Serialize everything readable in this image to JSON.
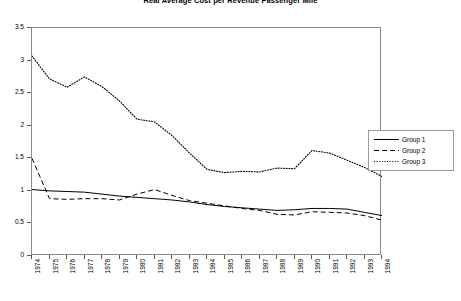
{
  "chart_data": {
    "type": "line",
    "title": "Real Average Cost per Revenue Passenger Mile",
    "xlabel": "",
    "ylabel": "",
    "xlim": [
      1974,
      1994
    ],
    "ylim": [
      0,
      3.5
    ],
    "ytick_labels": [
      "3.5",
      "3",
      "2.5",
      "2",
      "1.5",
      "1",
      "0.5",
      "0"
    ],
    "ytick_values": [
      3.5,
      3,
      2.5,
      2,
      1.5,
      1,
      0.5,
      0
    ],
    "grid": false,
    "legend_position": "right",
    "categories": [
      "1974",
      "1975",
      "1976",
      "1977",
      "1978",
      "1979",
      "1980",
      "1981",
      "1982",
      "1983",
      "1984",
      "1985",
      "1986",
      "1987",
      "1988",
      "1989",
      "1990",
      "1991",
      "1992",
      "1993",
      "1994"
    ],
    "series": [
      {
        "name": "Group 1",
        "style": "solid",
        "values": [
          1.02,
          1.0,
          0.99,
          0.98,
          0.95,
          0.92,
          0.9,
          0.88,
          0.86,
          0.83,
          0.79,
          0.76,
          0.74,
          0.72,
          0.7,
          0.71,
          0.73,
          0.73,
          0.72,
          0.67,
          0.62
        ]
      },
      {
        "name": "Group 2",
        "style": "dashed",
        "values": [
          1.5,
          0.88,
          0.87,
          0.88,
          0.88,
          0.86,
          0.95,
          1.02,
          0.93,
          0.85,
          0.81,
          0.77,
          0.73,
          0.7,
          0.64,
          0.63,
          0.68,
          0.67,
          0.66,
          0.62,
          0.55
        ]
      },
      {
        "name": "Group 3",
        "style": "dotted",
        "values": [
          3.07,
          2.72,
          2.59,
          2.75,
          2.6,
          2.38,
          2.1,
          2.06,
          1.85,
          1.58,
          1.33,
          1.28,
          1.3,
          1.29,
          1.35,
          1.34,
          1.62,
          1.58,
          1.47,
          1.36,
          1.22
        ]
      }
    ]
  },
  "legend": {
    "entries": [
      {
        "label": "Group 1"
      },
      {
        "label": "Group 2"
      },
      {
        "label": "Group 3"
      }
    ]
  }
}
